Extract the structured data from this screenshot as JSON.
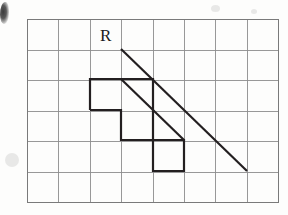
{
  "figure": {
    "kind": "grid-geometry-diagram",
    "labels": [
      {
        "name": "region-label-R",
        "text": "R",
        "x": 100,
        "y": 27
      }
    ],
    "grid": {
      "origin_x": 27,
      "origin_y": 19,
      "cell_width": 31.4,
      "cell_height": 30.5,
      "cols": 8,
      "rows": 6,
      "line_color": "#8d8d8d",
      "line_width": 0.9,
      "border_color": "#7a7a7a",
      "border_width": 1.1
    },
    "polygon": {
      "name": "staircase-polygon",
      "stroke": "#231f20",
      "stroke_width": 2.2,
      "fill": "none",
      "points": "90,79 153,79 153,110 121,110 121,140 184,140 184,171 153,171 153,140 121,140 121,110 90,110"
    },
    "polyline_outline": {
      "name": "staircase-outline",
      "points": "90,110 90,79 153,79 153,140 184,140 184,171 153,171 153,140 121,140 121,110 90,110"
    },
    "diagonals": [
      {
        "name": "upper-diagonal-ray",
        "x1": 121,
        "y1": 49,
        "x2": 247,
        "y2": 171,
        "stroke": "#231f20",
        "stroke_width": 2.2
      },
      {
        "name": "lower-diagonal-ray",
        "x1": 121,
        "y1": 79,
        "x2": 184,
        "y2": 140,
        "stroke": "#231f20",
        "stroke_width": 2.2
      }
    ],
    "artifacts": {
      "corner_smudge": {
        "name": "scan-smudge",
        "visible": true
      },
      "specks": [
        {
          "x": 12,
          "y": 160,
          "r": 7
        },
        {
          "x": 215,
          "y": 9,
          "r": 4
        },
        {
          "x": 255,
          "y": 12,
          "r": 3
        }
      ]
    },
    "colors": {
      "paper": "#fdfdfc",
      "ink": "#231f20",
      "grid": "#8d8d8d"
    }
  }
}
